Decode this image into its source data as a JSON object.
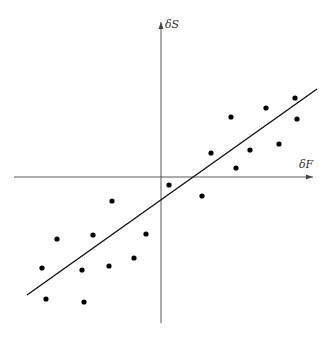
{
  "chart_data": {
    "type": "scatter",
    "title": "",
    "xlabel": "δF",
    "ylabel": "δS",
    "grid": false,
    "legend": null,
    "axes_style": "cross-through-origin with arrowheads",
    "units": "relative (pixels from origin, y up)",
    "xlim": [
      -147,
      152
    ],
    "ylim": [
      -146,
      155
    ],
    "points": [
      {
        "x": 134,
        "y": 79
      },
      {
        "x": 105,
        "y": 69
      },
      {
        "x": 70,
        "y": 60
      },
      {
        "x": 136,
        "y": 58
      },
      {
        "x": 118,
        "y": 33
      },
      {
        "x": 89,
        "y": 27
      },
      {
        "x": 50,
        "y": 24
      },
      {
        "x": 75,
        "y": 9
      },
      {
        "x": 8,
        "y": -8
      },
      {
        "x": 41,
        "y": -19
      },
      {
        "x": -49,
        "y": -24
      },
      {
        "x": -15,
        "y": -57
      },
      {
        "x": -68,
        "y": -58
      },
      {
        "x": -104,
        "y": -62
      },
      {
        "x": -27,
        "y": -81
      },
      {
        "x": -52,
        "y": -89
      },
      {
        "x": -119,
        "y": -91
      },
      {
        "x": -79,
        "y": -93
      },
      {
        "x": -115,
        "y": -122
      },
      {
        "x": -77,
        "y": -125
      }
    ],
    "fit_line": {
      "type": "linear",
      "from": {
        "x": -134,
        "y": -118
      },
      "to": {
        "x": 156,
        "y": 88
      }
    }
  },
  "layout": {
    "origin_px": {
      "x": 161,
      "y": 177
    },
    "x_axis_px": {
      "x1": 14,
      "x2": 313
    },
    "y_axis_px": {
      "y1": 22,
      "y2": 323
    },
    "point_radius": 2.6,
    "colors": {
      "axis": "#444444",
      "point": "#000000",
      "line": "#111111",
      "label": "#333333"
    }
  }
}
